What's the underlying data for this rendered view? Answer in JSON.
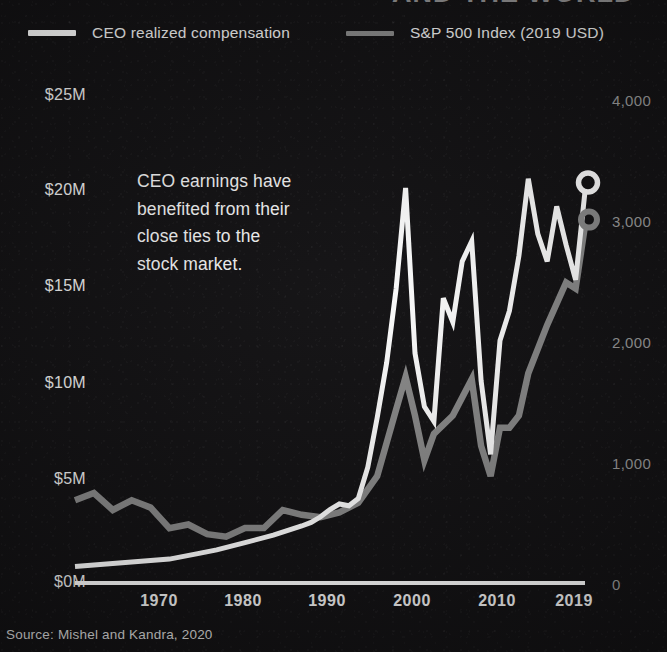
{
  "background_color": "#111012",
  "title_partial": "AND THE WORLD",
  "legend": {
    "items": [
      {
        "label": "CEO realized compensation",
        "color": "#ffffff",
        "name": "ceo"
      },
      {
        "label": "S&P 500 Index (2019 USD)",
        "color": "#8a8a8a",
        "name": "sp500"
      }
    ]
  },
  "annotation": {
    "lines": [
      "CEO earnings have",
      "benefited from their",
      "close ties to the",
      "stock market."
    ]
  },
  "source": "Source: Mishel and Kandra, 2020",
  "axes": {
    "y_left": {
      "ticks": [
        "$25M",
        "$20M",
        "$15M",
        "$10M",
        "$5M",
        "$0M"
      ],
      "values": [
        25,
        20,
        15,
        10,
        5,
        0
      ],
      "color": "#f0f0f0",
      "unit": "millions USD"
    },
    "y_right": {
      "ticks": [
        "4,000",
        "3,000",
        "2,000",
        "1,000",
        "0"
      ],
      "values": [
        4000,
        3000,
        2000,
        1000,
        0
      ],
      "color": "#9a9a9a",
      "unit": "index points"
    },
    "x": {
      "ticks": [
        "1970",
        "1980",
        "1990",
        "2000",
        "2010",
        "2019"
      ],
      "values": [
        1970,
        1980,
        1990,
        2000,
        2010,
        2019
      ]
    }
  },
  "chart_data": {
    "type": "line",
    "xlabel": "",
    "ylabel": "CEO realized compensation (2019 USD)",
    "ylabel_right": "S&P 500 Index (2019 USD)",
    "xlim": [
      1965,
      2019
    ],
    "ylim": [
      0,
      26.5
    ],
    "ylim_right": [
      0,
      4350
    ],
    "grid": false,
    "legend_position": "top-left",
    "series": [
      {
        "name": "CEO realized compensation",
        "color": "#ffffff",
        "axis": "left",
        "unit": "millions USD",
        "end_marker": "hollow-circle",
        "x": [
          1965,
          1970,
          1975,
          1978,
          1980,
          1983,
          1986,
          1989,
          1990,
          1991,
          1992,
          1993,
          1994,
          1995,
          1996,
          1997,
          1998,
          1999,
          2000,
          2001,
          2002,
          2003,
          2004,
          2005,
          2006,
          2007,
          2008,
          2009,
          2010,
          2011,
          2012,
          2013,
          2014,
          2015,
          2016,
          2017,
          2018,
          2019
        ],
        "values": [
          0.9,
          1.1,
          1.3,
          1.6,
          1.8,
          2.2,
          2.6,
          3.1,
          3.3,
          3.6,
          4.0,
          4.3,
          4.2,
          4.6,
          6.3,
          9.0,
          12.0,
          16.0,
          21.5,
          12.5,
          9.6,
          8.8,
          15.5,
          14.2,
          17.5,
          18.6,
          11.0,
          7.0,
          13.2,
          14.8,
          17.8,
          22.0,
          19.0,
          17.5,
          20.5,
          18.4,
          16.5,
          21.3
        ]
      },
      {
        "name": "S&P 500 Index (2019 USD)",
        "color": "#8a8a8a",
        "axis": "right",
        "unit": "index points",
        "end_marker": "hollow-circle",
        "x": [
          1965,
          1967,
          1969,
          1971,
          1973,
          1975,
          1977,
          1979,
          1981,
          1983,
          1985,
          1987,
          1989,
          1991,
          1993,
          1995,
          1997,
          1999,
          2000,
          2001,
          2002,
          2003,
          2005,
          2007,
          2008,
          2009,
          2010,
          2011,
          2012,
          2013,
          2015,
          2017,
          2018,
          2019
        ],
        "values": [
          700,
          760,
          620,
          700,
          640,
          470,
          500,
          420,
          400,
          470,
          470,
          620,
          580,
          560,
          600,
          680,
          900,
          1450,
          1720,
          1400,
          1030,
          1250,
          1400,
          1700,
          1150,
          900,
          1300,
          1300,
          1400,
          1750,
          2150,
          2500,
          2450,
          2970
        ]
      }
    ],
    "annotation_note": "CEO earnings have benefited from their close ties to the stock market."
  },
  "geometry": {
    "plot_left": 75,
    "plot_right": 585,
    "plot_top": 96,
    "plot_bottom": 583,
    "left_tick_y": [
      96,
      191,
      287,
      384,
      480,
      583
    ],
    "right_tick_y": [
      101,
      222,
      343,
      464,
      585
    ],
    "x_tick_x": [
      159,
      243,
      327,
      412,
      497,
      574
    ]
  }
}
